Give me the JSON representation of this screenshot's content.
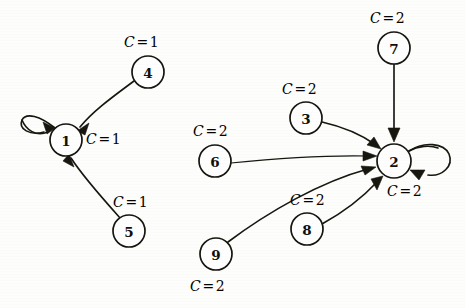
{
  "figure": {
    "kind": "directed-graph",
    "background_color": "#fdfdfc",
    "ink_color": "#17160f",
    "width": 465,
    "height": 308
  },
  "nodes": [
    {
      "id": "1",
      "label": "1",
      "cx": 66,
      "cy": 140,
      "r": 16
    },
    {
      "id": "4",
      "label": "4",
      "cx": 148,
      "cy": 72,
      "r": 16
    },
    {
      "id": "5",
      "label": "5",
      "cx": 129,
      "cy": 231,
      "r": 16
    },
    {
      "id": "6",
      "label": "6",
      "cx": 215,
      "cy": 161,
      "r": 16
    },
    {
      "id": "3",
      "label": "3",
      "cx": 306,
      "cy": 118,
      "r": 16
    },
    {
      "id": "7",
      "label": "7",
      "cx": 394,
      "cy": 48,
      "r": 16
    },
    {
      "id": "2",
      "label": "2",
      "cx": 394,
      "cy": 161,
      "r": 17
    },
    {
      "id": "8",
      "label": "8",
      "cx": 307,
      "cy": 229,
      "r": 16
    },
    {
      "id": "9",
      "label": "9",
      "cx": 216,
      "cy": 254,
      "r": 16
    }
  ],
  "edges": [
    {
      "id": "e-1-1",
      "from": "1",
      "to": "1",
      "kind": "self-loop"
    },
    {
      "id": "e-4-1",
      "from": "4",
      "to": "1",
      "kind": "curve"
    },
    {
      "id": "e-5-1",
      "from": "5",
      "to": "1",
      "kind": "curve"
    },
    {
      "id": "e-7-2",
      "from": "7",
      "to": "2",
      "kind": "straight"
    },
    {
      "id": "e-3-2",
      "from": "3",
      "to": "2",
      "kind": "curve"
    },
    {
      "id": "e-6-2",
      "from": "6",
      "to": "2",
      "kind": "curve"
    },
    {
      "id": "e-9-2",
      "from": "9",
      "to": "2",
      "kind": "curve"
    },
    {
      "id": "e-8-2",
      "from": "8",
      "to": "2",
      "kind": "curve"
    },
    {
      "id": "e-2-2",
      "from": "2",
      "to": "2",
      "kind": "self-loop"
    }
  ],
  "labels": {
    "cost_4": {
      "var": "C",
      "eq": "=",
      "value": "1",
      "x": 124,
      "y": 34
    },
    "cost_1": {
      "var": "C",
      "eq": "=",
      "value": "1",
      "x": 86,
      "y": 131
    },
    "cost_5": {
      "var": "C",
      "eq": "=",
      "value": "1",
      "x": 113,
      "y": 194
    },
    "cost_6": {
      "var": "C",
      "eq": "=",
      "value": "2",
      "x": 193,
      "y": 123
    },
    "cost_3": {
      "var": "C",
      "eq": "=",
      "value": "2",
      "x": 282,
      "y": 81
    },
    "cost_7": {
      "var": "C",
      "eq": "=",
      "value": "2",
      "x": 370,
      "y": 10
    },
    "cost_2": {
      "var": "C",
      "eq": "=",
      "value": "2",
      "x": 387,
      "y": 183
    },
    "cost_8": {
      "var": "C",
      "eq": "=",
      "value": "2",
      "x": 290,
      "y": 192
    },
    "cost_9": {
      "var": "C",
      "eq": "=",
      "value": "2",
      "x": 190,
      "y": 278
    }
  }
}
